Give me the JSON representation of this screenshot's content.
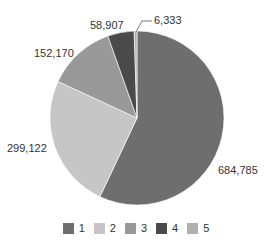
{
  "chart_data": {
    "type": "pie",
    "title": "",
    "categories": [
      "1",
      "2",
      "3",
      "4",
      "5"
    ],
    "values": [
      684785,
      299122,
      152170,
      58907,
      6333
    ],
    "labels": [
      "684,785",
      "299,122",
      "152,170",
      "58,907",
      "6,333"
    ],
    "colors": [
      "#6e6e6e",
      "#c6c6c6",
      "#999999",
      "#4a4a4a",
      "#b0b0b0"
    ],
    "start_angle_deg": 0,
    "direction": "clockwise",
    "legend_position": "bottom"
  },
  "legend": {
    "items": [
      {
        "label": "1",
        "color": "#6e6e6e"
      },
      {
        "label": "2",
        "color": "#c6c6c6"
      },
      {
        "label": "3",
        "color": "#999999"
      },
      {
        "label": "4",
        "color": "#4a4a4a"
      },
      {
        "label": "5",
        "color": "#b0b0b0"
      }
    ]
  }
}
